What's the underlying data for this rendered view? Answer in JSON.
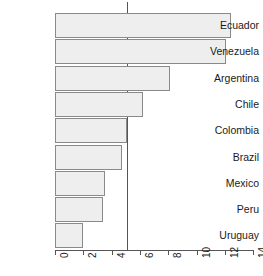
{
  "chart_data": {
    "type": "bar",
    "orientation": "horizontal",
    "title": "",
    "subtitle": "",
    "xlabel": "",
    "ylabel": "",
    "categories": [
      "Ecuador",
      "Venezuela",
      "Argentina",
      "Chile",
      "Colombia",
      "Brazil",
      "Mexico",
      "Peru",
      "Uruguay"
    ],
    "values": [
      12.4,
      12.1,
      8.1,
      6.2,
      5.05,
      4.7,
      3.5,
      3.4,
      2.0
    ],
    "xlim": [
      0,
      14
    ],
    "ylim": [
      0,
      9
    ],
    "xticks": [
      0,
      2,
      4,
      6,
      8,
      10,
      12,
      14
    ],
    "xticklabels": [
      "0",
      "2",
      "4",
      "6",
      "8",
      "10",
      "12",
      "14"
    ],
    "xtick_label_rotation": 90,
    "grid": false,
    "legend": null,
    "legend_position": "none",
    "annotations": [
      {
        "kind": "vertical-reference-line",
        "value": 5.05,
        "label": ""
      }
    ],
    "bar_fill_color": "#eeeeee",
    "bar_border_color": "#8a8a8a",
    "axis_color": "#555555",
    "reference_line_color": "#555555",
    "background_color": "#ffffff"
  }
}
